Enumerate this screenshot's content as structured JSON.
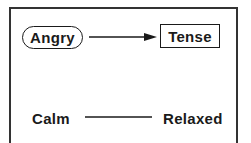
{
  "diagram": {
    "nodes": [
      {
        "id": "angry",
        "label": "Angry",
        "shape": "oval"
      },
      {
        "id": "tense",
        "label": "Tense",
        "shape": "rectangle"
      },
      {
        "id": "calm",
        "label": "Calm",
        "shape": "none"
      },
      {
        "id": "relaxed",
        "label": "Relaxed",
        "shape": "none"
      }
    ],
    "edges": [
      {
        "from": "angry",
        "to": "tense",
        "type": "arrow"
      },
      {
        "from": "calm",
        "to": "relaxed",
        "type": "line"
      }
    ],
    "colors": {
      "stroke": "#1a1a1a",
      "frame": "#333333",
      "background": "#ffffff"
    }
  }
}
